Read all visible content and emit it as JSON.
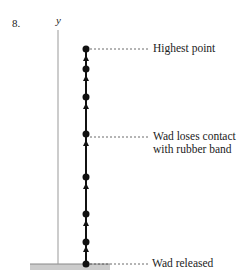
{
  "problem_number": "8.",
  "axis_label": "y",
  "labels": {
    "highest": "Highest point",
    "contact_line1": "Wad loses contact",
    "contact_line2": "with rubber band",
    "released": "Wad released"
  },
  "dots_y": [
    49,
    69,
    97,
    134,
    177,
    214,
    242,
    264
  ],
  "colors": {
    "ink": "#111111",
    "axis": "#999999",
    "ground": "#cccccc"
  }
}
